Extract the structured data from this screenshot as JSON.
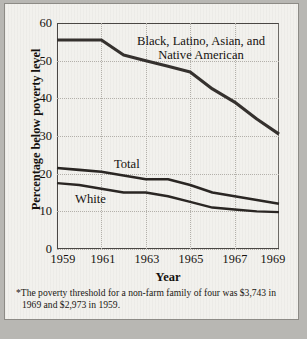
{
  "chart_data": {
    "type": "line",
    "title": "",
    "xlabel": "Year",
    "ylabel": "Percentage below poverty level",
    "xlim": [
      1959,
      1969
    ],
    "ylim": [
      0,
      60
    ],
    "yticks": [
      0,
      10,
      20,
      30,
      40,
      50,
      60
    ],
    "ytick_labels": [
      "0",
      "10",
      "20",
      "30",
      "40",
      "50",
      "60"
    ],
    "xticks": [
      1959,
      1961,
      1963,
      1965,
      1967,
      1969
    ],
    "xtick_labels": [
      "1959",
      "1961",
      "1963",
      "1965",
      "1967",
      "1969"
    ],
    "grid": true,
    "legend": "inline-annotations",
    "x": [
      1959,
      1960,
      1961,
      1962,
      1963,
      1964,
      1965,
      1966,
      1967,
      1968,
      1969
    ],
    "series": [
      {
        "name": "Black, Latino, Asian, and Native American",
        "values": [
          55.5,
          55.5,
          55.5,
          51.5,
          50.0,
          48.5,
          47.0,
          42.5,
          39.0,
          34.5,
          30.5
        ],
        "color": "#35312e"
      },
      {
        "name": "Total",
        "values": [
          21.5,
          21.0,
          20.5,
          19.5,
          18.5,
          18.5,
          17.0,
          15.0,
          14.0,
          13.0,
          12.0
        ],
        "color": "#2a2623"
      },
      {
        "name": "White",
        "values": [
          17.5,
          17.0,
          16.0,
          15.0,
          15.0,
          14.0,
          12.5,
          11.0,
          10.5,
          10.0,
          9.8
        ],
        "color": "#2a2623"
      }
    ],
    "annotations": [
      {
        "text_line1": "Black, Latino, Asian, and",
        "text_line2": "Native American"
      },
      {
        "text": "Total"
      },
      {
        "text": "White"
      }
    ]
  },
  "axes": {
    "y_title": "Percentage below poverty level",
    "x_title": "Year"
  },
  "labels": {
    "minority_line1": "Black, Latino, Asian, and",
    "minority_line2": "Native American",
    "total": "Total",
    "white": "White"
  },
  "footnote": {
    "line1": "*The poverty threshold for a non-farm family of four was  $3,743",
    "line2": "in 1969 and $2,973 in 1959."
  },
  "colors": {
    "background": "#f2f1ed",
    "outer": "#b8b7b3",
    "line": "#2f2b28",
    "grid": "#b3b0aa",
    "axis": "#4a4744",
    "text": "#15120f"
  }
}
